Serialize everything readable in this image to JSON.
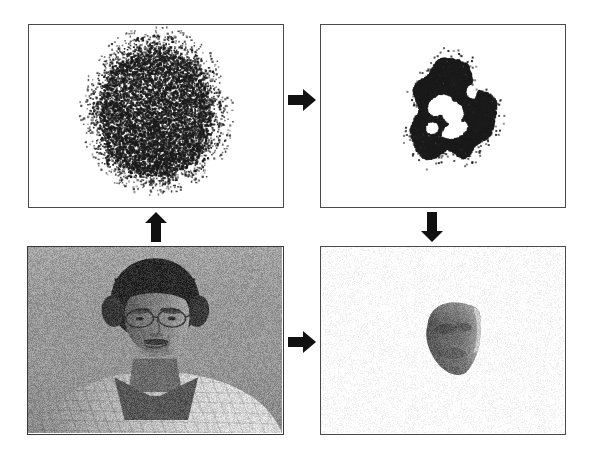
{
  "figure": {
    "background_color": "#ffffff",
    "panel_border_color": "#4a4a4a",
    "grid": {
      "rows": 2,
      "columns": 2
    }
  },
  "panels": [
    {
      "id": "raw-cloud",
      "position": "top-left",
      "label": "Raw 3D point cloud",
      "content_type": "point-cloud",
      "point_color": "#1b1b1b",
      "background_color": "#ffffff",
      "point_count": 9000,
      "shape": "dense blob, heart-like outline with notch at top center",
      "coverage_percent": 27
    },
    {
      "id": "segmented-cloud",
      "position": "top-right",
      "label": "Segmented face point cloud",
      "content_type": "point-cloud",
      "point_color": "#1b1b1b",
      "background_color": "#ffffff",
      "point_count": 3200,
      "shape": "cropped face region with white holes at eye and nose areas",
      "coverage_percent": 9
    },
    {
      "id": "photo",
      "position": "bottom-left",
      "label": "Input grayscale photograph",
      "content_type": "photograph",
      "subject": "man with dark hair, eyeglasses and moustache wearing a light patterned collared shirt",
      "background_color": "#9a9a9a",
      "is_grayscale": true
    },
    {
      "id": "face-model",
      "position": "bottom-right",
      "label": "Textured 3D face model",
      "content_type": "textured-mesh",
      "background_color": "#ffffff",
      "mesh_color": "#7c7c7c",
      "highlight_color": "#d8d8d8",
      "shape": "three-quarter face surface patch"
    }
  ],
  "arrows": [
    {
      "id": "scan-to-segment",
      "direction": "right",
      "from": "raw-cloud",
      "to": "segmented-cloud",
      "color": "#111111"
    },
    {
      "id": "photo-to-scan",
      "direction": "up",
      "from": "photo",
      "to": "raw-cloud",
      "color": "#111111"
    },
    {
      "id": "segment-to-model",
      "direction": "down",
      "from": "segmented-cloud",
      "to": "face-model",
      "color": "#111111"
    },
    {
      "id": "photo-to-model",
      "direction": "right",
      "from": "photo",
      "to": "face-model",
      "color": "#111111"
    }
  ]
}
